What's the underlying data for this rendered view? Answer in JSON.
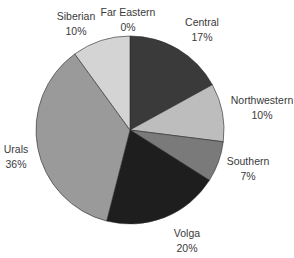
{
  "chart_data": {
    "type": "pie",
    "title": "",
    "start_angle_deg": 0,
    "direction": "clockwise",
    "categories": [
      "Central",
      "Northwestern",
      "Southern",
      "Volga",
      "Urals",
      "Siberian",
      "Far Eastern"
    ],
    "values": [
      17,
      10,
      7,
      20,
      36,
      10,
      0
    ],
    "value_labels": [
      "17%",
      "10%",
      "7%",
      "20%",
      "36%",
      "10%",
      "0%"
    ],
    "colors": [
      "#3a3a3a",
      "#bdbdbd",
      "#7a7a7a",
      "#1e1e1e",
      "#9a9a9a",
      "#d4d4d4",
      "#ffffff"
    ],
    "legend": "none",
    "slices": [
      {
        "name": "Central",
        "value": 17,
        "pct": "17%",
        "color": "#3a3a3a",
        "label_x": 202,
        "label_y": 15
      },
      {
        "name": "Northwestern",
        "value": 10,
        "pct": "10%",
        "color": "#bdbdbd",
        "label_x": 262,
        "label_y": 93
      },
      {
        "name": "Southern",
        "value": 7,
        "pct": "7%",
        "color": "#7a7a7a",
        "label_x": 248,
        "label_y": 154
      },
      {
        "name": "Volga",
        "value": 20,
        "pct": "20%",
        "color": "#1e1e1e",
        "label_x": 187,
        "label_y": 226
      },
      {
        "name": "Urals",
        "value": 36,
        "pct": "36%",
        "color": "#9a9a9a",
        "label_x": 16,
        "label_y": 142
      },
      {
        "name": "Siberian",
        "value": 10,
        "pct": "10%",
        "color": "#d4d4d4",
        "label_x": 76,
        "label_y": 9
      },
      {
        "name": "Far Eastern",
        "value": 0,
        "pct": "0%",
        "color": "#ffffff",
        "label_x": 128,
        "label_y": 5
      }
    ]
  },
  "geometry": {
    "cx": 130,
    "cy": 130,
    "r": 94
  }
}
